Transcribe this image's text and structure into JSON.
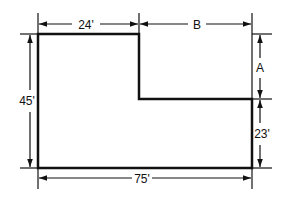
{
  "diagram": {
    "type": "L-shaped floor plan with dimensions",
    "colors": {
      "line": "#111111",
      "background": "#ffffff"
    },
    "dimensions": {
      "top_left": "24'",
      "top_right": "B",
      "left": "45'",
      "right_upper": "A",
      "right_lower": "23'",
      "bottom": "75'"
    }
  }
}
